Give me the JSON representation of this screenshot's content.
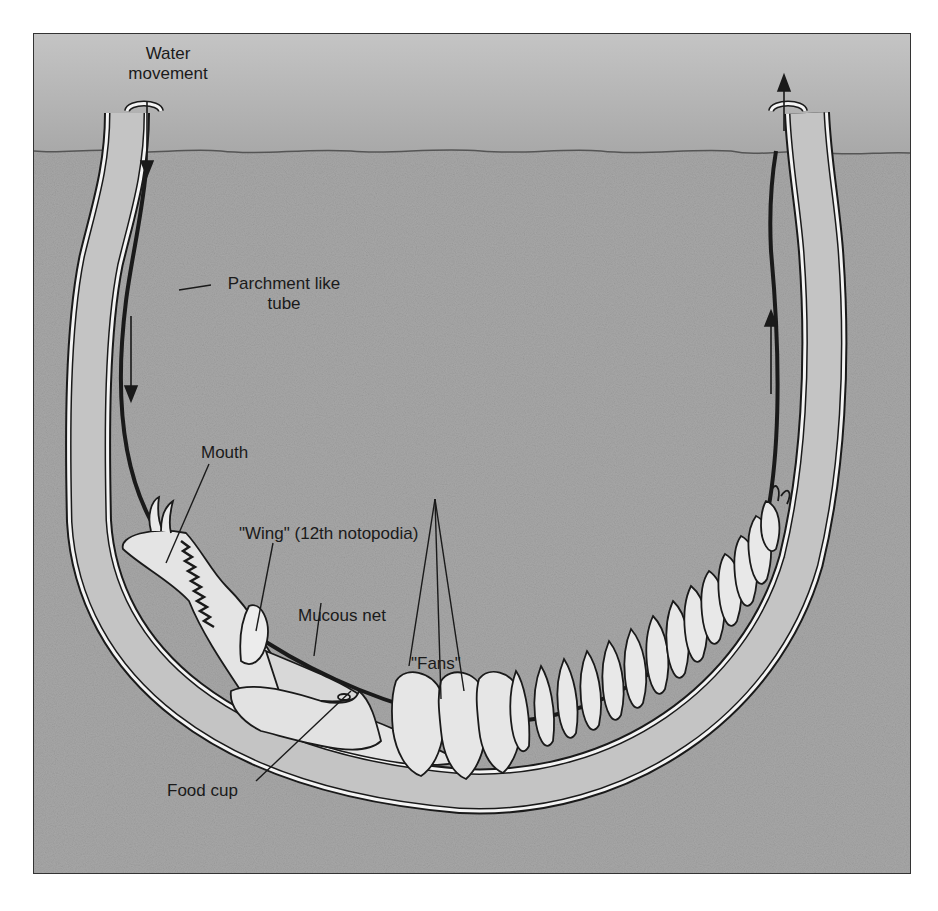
{
  "figure": {
    "colors": {
      "water": "#b8b8b8",
      "sediment": "#a6a6a6",
      "tube_wall": "#f4f4f4",
      "tube_interior": "#c9c9c9",
      "worm_body": "#e6e6e6",
      "outline": "#1a1a1a"
    }
  },
  "labels": {
    "water_movement": [
      "Water",
      "movement"
    ],
    "parchment_tube": [
      "Parchment like",
      "tube"
    ],
    "mouth": "Mouth",
    "wing": "\"Wing\" (12th notopodia)",
    "mucous_net": "Mucous net",
    "fans": "\"Fans\"",
    "food_cup": "Food cup"
  },
  "arrows": [
    {
      "name": "inflow-top-left",
      "direction": "down"
    },
    {
      "name": "inflow-left-tube",
      "direction": "down"
    },
    {
      "name": "outflow-right-tube",
      "direction": "up"
    },
    {
      "name": "outflow-top-right",
      "direction": "up"
    }
  ]
}
